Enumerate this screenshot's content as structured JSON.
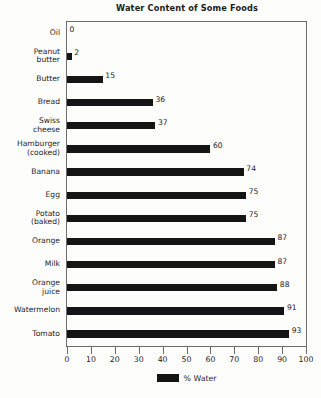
{
  "chart_data": {
    "type": "bar",
    "orientation": "horizontal",
    "title": "Water Content of Some Foods",
    "xlabel": "",
    "ylabel": "",
    "xlim": [
      0,
      100
    ],
    "xticks": [
      0,
      10,
      20,
      30,
      40,
      50,
      60,
      70,
      80,
      90,
      100
    ],
    "grid": false,
    "legend": {
      "position": "bottom",
      "entries": [
        {
          "label": "% Water",
          "color": "#151515"
        }
      ]
    },
    "series": [
      {
        "name": "% Water",
        "color": "#151515",
        "values": [
          0,
          2,
          15,
          36,
          37,
          60,
          74,
          75,
          75,
          87,
          87,
          88,
          91,
          93
        ]
      }
    ],
    "categories": [
      "Oil",
      "Peanut butter",
      "Butter",
      "Bread",
      "Swiss cheese",
      "Hamburger (cooked)",
      "Banana",
      "Egg",
      "Potato (baked)",
      "Orange",
      "Milk",
      "Orange juice",
      "Watermelon",
      "Tomato"
    ],
    "category_lines": [
      [
        "Oil"
      ],
      [
        "Peanut",
        "butter"
      ],
      [
        "Butter"
      ],
      [
        "Bread"
      ],
      [
        "Swiss",
        "cheese"
      ],
      [
        "Hamburger",
        "(cooked)"
      ],
      [
        "Banana"
      ],
      [
        "Egg"
      ],
      [
        "Potato",
        "(baked)"
      ],
      [
        "Orange"
      ],
      [
        "Milk"
      ],
      [
        "Orange",
        "juice"
      ],
      [
        "Watermelon"
      ],
      [
        "Tomato"
      ]
    ],
    "data_labels": [
      "0",
      "2",
      "15",
      "36",
      "37",
      "60",
      "74",
      "75",
      "75",
      "87",
      "87",
      "88",
      "91",
      "93"
    ]
  },
  "colors": {
    "bar": "#151515",
    "frame": "#6d6d6d",
    "text": "#1c1c1c",
    "background": "#fdfdfc"
  }
}
